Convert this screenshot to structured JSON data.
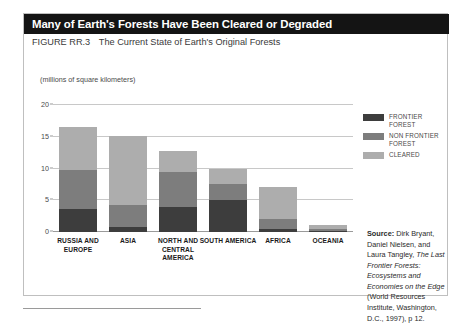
{
  "figure": {
    "headline": "Many of Earth's Forests Have Been Cleared or Degraded",
    "figure_number": "FIGURE RR.3",
    "caption": "The Current State of Earth's Original Forests",
    "axis_note": "(millions of square kilometers)"
  },
  "legend": {
    "items": [
      {
        "label": "FRONTIER FOREST",
        "color": "#3d3d3d"
      },
      {
        "label": "NON FRONTIER FOREST",
        "color": "#7d7d7d"
      },
      {
        "label": "CLEARED",
        "color": "#adadad"
      }
    ]
  },
  "source": {
    "lead": "Source:",
    "text_part_1": " Dirk Bryant, Daniel Nielsen, and Laura Tangley, ",
    "italic_title": "The Last Frontier Forests: Ecosystems and Economies on the Edge",
    "text_part_2": " (World Resources Institute, Washington, D.C., 1997), p 12."
  },
  "chart_data": {
    "type": "bar",
    "title": "Many of Earth's Forests Have Been Cleared or Degraded",
    "subtitle": "The Current State of Earth's Original Forests",
    "xlabel": "",
    "ylabel": "millions of square kilometers",
    "ylim": [
      0,
      20
    ],
    "yticks": [
      0,
      5,
      10,
      15,
      20
    ],
    "ytick_labels": [
      "0",
      "5",
      "10",
      "15",
      "20"
    ],
    "grid": true,
    "stacked": true,
    "legend_position": "right",
    "categories": [
      "RUSSIA AND EUROPE",
      "ASIA",
      "NORTH AND CENTRAL AMERICA",
      "SOUTH AMERICA",
      "AFRICA",
      "OCEANIA"
    ],
    "series": [
      {
        "name": "FRONTIER FOREST",
        "color": "#3d3d3d",
        "values": [
          3.6,
          0.8,
          4.0,
          5.1,
          0.4,
          0.2
        ]
      },
      {
        "name": "NON FRONTIER FOREST",
        "color": "#7d7d7d",
        "values": [
          6.1,
          3.4,
          5.5,
          2.5,
          1.6,
          0.3
        ]
      },
      {
        "name": "CLEARED",
        "color": "#adadad",
        "values": [
          6.9,
          11.0,
          3.3,
          2.3,
          5.1,
          0.6
        ]
      }
    ],
    "totals": [
      16.6,
      15.2,
      12.8,
      9.9,
      7.1,
      1.1
    ]
  }
}
